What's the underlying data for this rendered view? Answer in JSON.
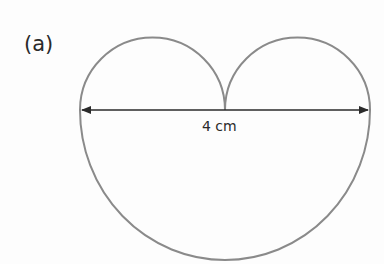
{
  "figure": {
    "part_label": "(a)",
    "dimension_label": "4 cm",
    "shape": "large semicircle below a diameter with two small semicircles above",
    "colors": {
      "outline": "#8a8a8a",
      "arrow": "#2a2a2a",
      "text": "#2a2a2a"
    }
  }
}
